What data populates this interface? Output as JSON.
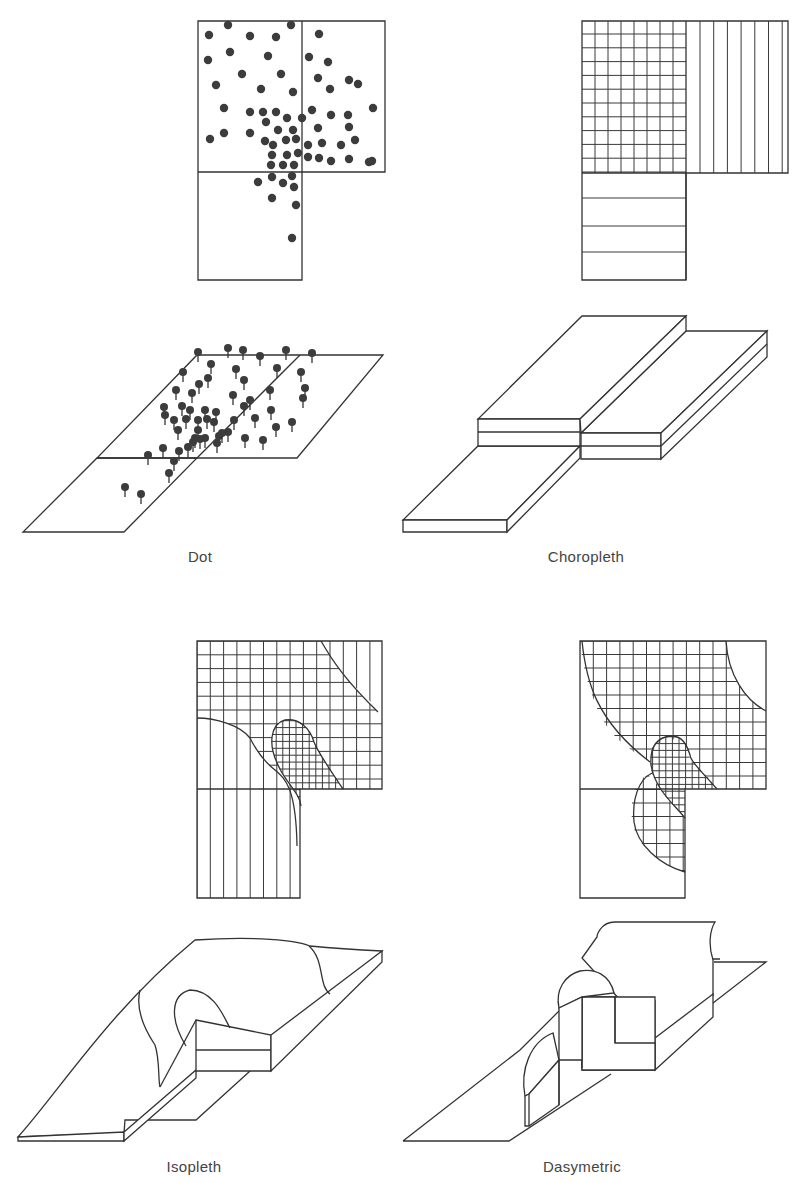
{
  "figure": {
    "panels": [
      {
        "id": "dot",
        "caption": "Dot",
        "caption_pos": [
          200,
          557
        ]
      },
      {
        "id": "choropleth",
        "caption": "Choropleth",
        "caption_pos": [
          586,
          557
        ]
      },
      {
        "id": "isopleth",
        "caption": "Isopleth",
        "caption_pos": [
          194,
          1167
        ]
      },
      {
        "id": "dasymetric",
        "caption": "Dasymetric",
        "caption_pos": [
          582,
          1167
        ]
      }
    ],
    "colors": {
      "line": "#333333",
      "dot": "#3c3c3c",
      "caption": "#444444",
      "background": "#ffffff"
    }
  },
  "captions": {
    "dot": "Dot",
    "choropleth": "Choropleth",
    "isopleth": "Isopleth",
    "dasymetric": "Dasymetric"
  },
  "dot_plan": {
    "dots": [
      [
        228,
        25
      ],
      [
        291,
        25
      ],
      [
        209,
        35
      ],
      [
        250,
        36
      ],
      [
        276,
        37
      ],
      [
        319,
        34
      ],
      [
        230,
        52
      ],
      [
        208,
        60
      ],
      [
        268,
        56
      ],
      [
        309,
        57
      ],
      [
        328,
        62
      ],
      [
        242,
        74
      ],
      [
        281,
        74
      ],
      [
        318,
        78
      ],
      [
        349,
        80
      ],
      [
        216,
        85
      ],
      [
        261,
        89
      ],
      [
        293,
        92
      ],
      [
        330,
        89
      ],
      [
        358,
        84
      ],
      [
        373,
        108
      ],
      [
        224,
        108
      ],
      [
        250,
        112
      ],
      [
        263,
        112
      ],
      [
        276,
        112
      ],
      [
        312,
        110
      ],
      [
        348,
        115
      ],
      [
        287,
        118
      ],
      [
        266,
        122
      ],
      [
        302,
        118
      ],
      [
        331,
        115
      ],
      [
        250,
        133
      ],
      [
        278,
        130
      ],
      [
        293,
        130
      ],
      [
        318,
        128
      ],
      [
        349,
        127
      ],
      [
        210,
        139
      ],
      [
        265,
        141
      ],
      [
        286,
        140
      ],
      [
        296,
        139
      ],
      [
        224,
        133
      ],
      [
        308,
        145
      ],
      [
        322,
        143
      ],
      [
        341,
        145
      ],
      [
        355,
        140
      ],
      [
        372,
        161
      ],
      [
        273,
        145
      ],
      [
        287,
        155
      ],
      [
        298,
        153
      ],
      [
        308,
        157
      ],
      [
        319,
        158
      ],
      [
        331,
        161
      ],
      [
        349,
        159
      ],
      [
        369,
        162
      ],
      [
        272,
        155
      ],
      [
        271,
        165
      ],
      [
        294,
        165
      ],
      [
        283,
        165
      ],
      [
        272,
        177
      ],
      [
        292,
        176
      ],
      [
        258,
        182
      ],
      [
        283,
        183
      ],
      [
        294,
        187
      ],
      [
        272,
        198
      ],
      [
        296,
        205
      ],
      [
        292,
        238
      ]
    ]
  },
  "dot_3d": {
    "pins": [
      [
        198,
        352
      ],
      [
        228,
        348
      ],
      [
        243,
        350
      ],
      [
        260,
        356
      ],
      [
        286,
        350
      ],
      [
        312,
        353
      ],
      [
        211,
        364
      ],
      [
        183,
        372
      ],
      [
        236,
        369
      ],
      [
        277,
        368
      ],
      [
        301,
        372
      ],
      [
        176,
        390
      ],
      [
        208,
        378
      ],
      [
        244,
        380
      ],
      [
        199,
        384
      ],
      [
        270,
        390
      ],
      [
        192,
        393
      ],
      [
        233,
        395
      ],
      [
        305,
        388
      ],
      [
        303,
        398
      ],
      [
        164,
        407
      ],
      [
        182,
        406
      ],
      [
        190,
        410
      ],
      [
        205,
        410
      ],
      [
        207,
        419
      ],
      [
        216,
        412
      ],
      [
        244,
        406
      ],
      [
        250,
        400
      ],
      [
        174,
        420
      ],
      [
        186,
        419
      ],
      [
        198,
        420
      ],
      [
        214,
        422
      ],
      [
        234,
        420
      ],
      [
        228,
        432
      ],
      [
        198,
        430
      ],
      [
        165,
        415
      ],
      [
        178,
        430
      ],
      [
        195,
        438
      ],
      [
        205,
        438
      ],
      [
        219,
        436
      ],
      [
        271,
        410
      ],
      [
        276,
        427
      ],
      [
        255,
        418
      ],
      [
        217,
        443
      ],
      [
        245,
        438
      ],
      [
        263,
        440
      ],
      [
        292,
        422
      ],
      [
        163,
        448
      ],
      [
        188,
        447
      ],
      [
        179,
        451
      ],
      [
        148,
        455
      ],
      [
        174,
        461
      ],
      [
        169,
        473
      ],
      [
        125,
        487
      ],
      [
        141,
        494
      ],
      [
        200,
        439
      ],
      [
        193,
        442
      ],
      [
        222,
        433
      ]
    ]
  },
  "labels": {}
}
